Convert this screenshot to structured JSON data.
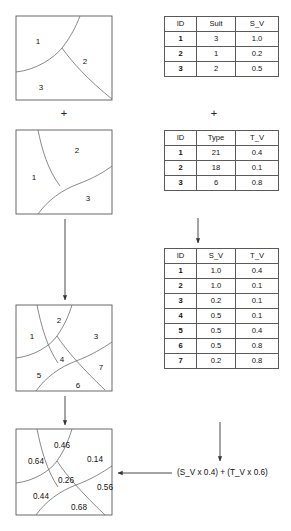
{
  "figure": {
    "title_hidden": "",
    "operators": {
      "plus_left": "+",
      "plus_right": "+"
    },
    "formula": "(S_V x 0.4) + (T_V x 0.6)"
  },
  "maps": {
    "suit_map": {
      "name": "suitability-map",
      "regions": [
        {
          "label": "1",
          "x": 38,
          "y": 42
        },
        {
          "label": "2",
          "x": 85,
          "y": 62
        },
        {
          "label": "3",
          "x": 41,
          "y": 88
        }
      ]
    },
    "type_map": {
      "name": "type-map",
      "regions": [
        {
          "label": "1",
          "x": 34,
          "y": 178
        },
        {
          "label": "2",
          "x": 77,
          "y": 151
        },
        {
          "label": "3",
          "x": 88,
          "y": 199
        }
      ]
    },
    "overlay_map": {
      "name": "overlay-map",
      "regions": [
        {
          "label": "1",
          "x": 32,
          "y": 337
        },
        {
          "label": "2",
          "x": 59,
          "y": 321
        },
        {
          "label": "3",
          "x": 96,
          "y": 337
        },
        {
          "label": "4",
          "x": 62,
          "y": 360
        },
        {
          "label": "5",
          "x": 39,
          "y": 376
        },
        {
          "label": "6",
          "x": 78,
          "y": 386
        },
        {
          "label": "7",
          "x": 101,
          "y": 368
        }
      ]
    },
    "result_map": {
      "name": "result-map",
      "regions": [
        {
          "label": "0.46",
          "x": 62,
          "y": 446
        },
        {
          "label": "0.64",
          "x": 36,
          "y": 462
        },
        {
          "label": "0.14",
          "x": 95,
          "y": 460
        },
        {
          "label": "0.26",
          "x": 66,
          "y": 481
        },
        {
          "label": "0.56",
          "x": 105,
          "y": 488
        },
        {
          "label": "0.44",
          "x": 41,
          "y": 497
        },
        {
          "label": "0.68",
          "x": 79,
          "y": 508
        }
      ]
    }
  },
  "tables": {
    "suit_table": {
      "name": "suitability-table",
      "headers": [
        "ID",
        "Suit",
        "S_V"
      ],
      "rows": [
        [
          "1",
          "3",
          "1.0"
        ],
        [
          "2",
          "1",
          "0.2"
        ],
        [
          "3",
          "2",
          "0.5"
        ]
      ]
    },
    "type_table": {
      "name": "type-table",
      "headers": [
        "ID",
        "Type",
        "T_V"
      ],
      "rows": [
        [
          "1",
          "21",
          "0.4"
        ],
        [
          "2",
          "18",
          "0.1"
        ],
        [
          "3",
          "6",
          "0.8"
        ]
      ]
    },
    "combined_table": {
      "name": "combined-table",
      "headers": [
        "ID",
        "S_V",
        "T_V"
      ],
      "rows": [
        [
          "1",
          "1.0",
          "0.4"
        ],
        [
          "2",
          "1.0",
          "0.1"
        ],
        [
          "3",
          "0.2",
          "0.1"
        ],
        [
          "4",
          "0.5",
          "0.1"
        ],
        [
          "5",
          "0.5",
          "0.4"
        ],
        [
          "6",
          "0.5",
          "0.8"
        ],
        [
          "7",
          "0.2",
          "0.8"
        ]
      ]
    }
  },
  "colors": {
    "stroke": "#5a5a5a",
    "arrow": "#333333",
    "text": "#111111",
    "background": "#ffffff"
  }
}
